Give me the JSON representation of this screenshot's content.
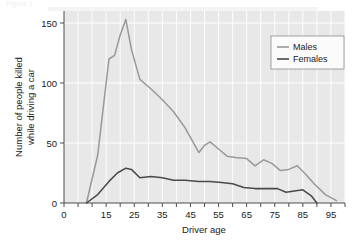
{
  "figure": {
    "faint_header_text": "Figure 1",
    "background_color": "#ffffff",
    "plot_background_color": "#e8e8e8",
    "gridline_color": "#ffffff",
    "axis_color": "#4d4d4d"
  },
  "legend": {
    "position": "top-right",
    "border_color": "#8c8c8c",
    "background_color": "#fbfbfb",
    "entries": [
      {
        "label": "Males",
        "color": "#9a9a9a"
      },
      {
        "label": "Females",
        "color": "#4a4a4a"
      }
    ]
  },
  "chart_data": {
    "type": "line",
    "title": "",
    "xlabel": "Driver age",
    "ylabel": "Number of people killed while driving a car",
    "ylabel_line1": "Number of people killed",
    "ylabel_line2": "while driving a car",
    "xlim": [
      0,
      100
    ],
    "ylim": [
      0,
      160
    ],
    "xticks": [
      0,
      15,
      25,
      35,
      45,
      55,
      65,
      75,
      85,
      95
    ],
    "xtick_labels": [
      "0",
      "15",
      "25",
      "35",
      "45",
      "55",
      "65",
      "75",
      "85",
      "95"
    ],
    "xminorticks": [
      5,
      10,
      20,
      30,
      40,
      50,
      60,
      70,
      80,
      90,
      100
    ],
    "yticks": [
      0,
      50,
      100,
      150
    ],
    "ytick_labels": [
      "0",
      "50",
      "100",
      "150"
    ],
    "grid": true,
    "grid_axis": "both",
    "legend_position": "upper right",
    "series": [
      {
        "name": "Males",
        "color": "#9a9a9a",
        "x": [
          8,
          12,
          16,
          18,
          20,
          22,
          24,
          27,
          31,
          35,
          39,
          43,
          48,
          50,
          52,
          55,
          58,
          61,
          65,
          68,
          71,
          74,
          77,
          80,
          83,
          86,
          89,
          93,
          97
        ],
        "values": [
          0,
          40,
          120,
          123,
          140,
          153,
          128,
          103,
          95,
          86,
          76,
          63,
          42,
          48,
          51,
          45,
          39,
          38,
          37,
          31,
          36,
          33,
          27,
          28,
          31,
          24,
          16,
          7,
          2
        ]
      },
      {
        "name": "Females",
        "color": "#4a4a4a",
        "x": [
          8,
          12,
          16,
          19,
          22,
          24,
          27,
          31,
          35,
          39,
          43,
          48,
          52,
          56,
          60,
          64,
          68,
          72,
          76,
          79,
          82,
          85,
          88,
          90
        ],
        "values": [
          0,
          7,
          18,
          25,
          29,
          28,
          21,
          22,
          21,
          19,
          19,
          18,
          18,
          17,
          16,
          13,
          12,
          12,
          12,
          9,
          10,
          11,
          6,
          0
        ]
      }
    ]
  }
}
